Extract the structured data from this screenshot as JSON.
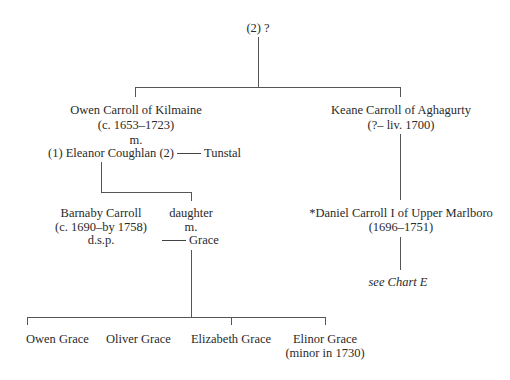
{
  "root": {
    "label": "(2) ?"
  },
  "generation1": {
    "owen": {
      "name": "Owen Carroll of Kilmaine",
      "dates": "(c. 1653–1723)",
      "married_label": "m.",
      "spouse1_prefix": "(1) Eleanor Coughlan (2)",
      "spouse2": "Tunstal"
    },
    "keane": {
      "name": "Keane Carroll of Aghagurty",
      "dates": "(?– liv. 1700)"
    }
  },
  "generation2": {
    "barnaby": {
      "name": "Barnaby Carroll",
      "dates": "(c. 1690–by 1758)",
      "note": "d.s.p."
    },
    "daughter": {
      "name": "daughter",
      "married_label": "m.",
      "spouse": "Grace"
    },
    "daniel": {
      "name": "*Daniel Carroll I of Upper Marlboro",
      "dates": "(1696–1751)",
      "reference": "see Chart E"
    }
  },
  "generation3": {
    "children": [
      {
        "name": "Owen Grace"
      },
      {
        "name": "Oliver Grace"
      },
      {
        "name": "Elizabeth Grace"
      },
      {
        "name": "Elinor Grace",
        "note": "(minor in 1730)"
      }
    ]
  }
}
